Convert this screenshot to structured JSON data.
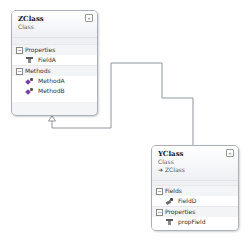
{
  "diagram": {
    "classes": [
      {
        "name": "ZClass",
        "kind": "Class",
        "base": null,
        "collapse_glyph": "«",
        "sections": [
          {
            "title": "Properties",
            "toggle": "−",
            "members": [
              {
                "name": "FieldA",
                "icon": "property-icon"
              }
            ]
          },
          {
            "title": "Methods",
            "toggle": "−",
            "members": [
              {
                "name": "MethodA",
                "icon": "method-icon"
              },
              {
                "name": "MethodB",
                "icon": "method-icon"
              }
            ]
          }
        ]
      },
      {
        "name": "YClass",
        "kind": "Class",
        "base": "➜ ZClass",
        "collapse_glyph": "«",
        "sections": [
          {
            "title": "Fields",
            "toggle": "−",
            "members": [
              {
                "name": "FieldD",
                "icon": "field-icon"
              }
            ]
          },
          {
            "title": "Properties",
            "toggle": "−",
            "members": [
              {
                "name": "propField",
                "icon": "property-icon"
              }
            ]
          }
        ]
      }
    ],
    "relationships": [
      {
        "type": "inheritance",
        "from": "YClass",
        "to": "ZClass"
      }
    ],
    "colors": {
      "line": "#8f969f",
      "border": "#a9b0b9",
      "header_bg": "#eef0f3"
    }
  }
}
